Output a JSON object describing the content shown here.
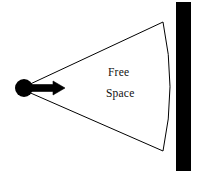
{
  "figure": {
    "background_color": "#ffffff",
    "ink_color": "#000000",
    "width": 201,
    "height": 173
  },
  "labels": {
    "region_line1": "Free",
    "region_line2": "Space"
  },
  "elements": {
    "source": {
      "name": "source-point",
      "center_x": 24,
      "center_y": 88,
      "radius": 9,
      "color": "#000000"
    },
    "direction_arrow": {
      "name": "propagation-arrow",
      "start_x": 28,
      "start_y": 88,
      "end_x": 65,
      "end_y": 88,
      "color": "#000000"
    },
    "cone": {
      "apex_x": 26,
      "apex_y": 88,
      "upper_end_x": 163,
      "upper_end_y": 22,
      "lower_end_x": 163,
      "lower_end_y": 151,
      "arc_bulge_x": 176,
      "arc_bulge_y": 87,
      "stroke_color": "#000000"
    },
    "wall": {
      "name": "wall-barrier",
      "x": 176,
      "y": 2,
      "width": 15,
      "height": 169,
      "color": "#000000"
    }
  }
}
